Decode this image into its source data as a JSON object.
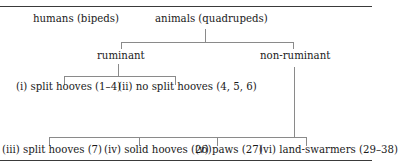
{
  "diagram": {
    "header_cut_text": "        ",
    "roots": [
      {
        "label": "humans (bipeds)"
      },
      {
        "label": "animals (quadrupeds)"
      }
    ],
    "level1": [
      {
        "label": "ruminant"
      },
      {
        "label": "non-ruminant"
      }
    ],
    "ruminant_children": [
      {
        "label": "(i) split hooves (1–4)"
      },
      {
        "label": "(ii) no split hooves (4, 5, 6)"
      }
    ],
    "non_ruminant_children": [
      {
        "label": "(iii) split hooves (7)"
      },
      {
        "label": "(iv) solid hooves (26)"
      },
      {
        "label": "(v) paws (27)"
      },
      {
        "label": "(vi) land-swarmers (29–38)"
      }
    ]
  }
}
